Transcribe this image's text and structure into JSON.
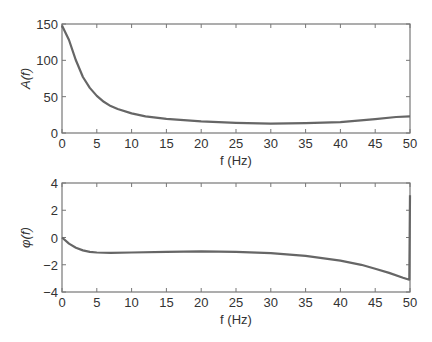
{
  "chart_data": [
    {
      "type": "line",
      "title": "",
      "xlabel": "f (Hz)",
      "ylabel": "A(f)",
      "xlim": [
        0,
        50
      ],
      "ylim": [
        0,
        150
      ],
      "xticks": [
        0,
        5,
        10,
        15,
        20,
        25,
        30,
        35,
        40,
        45,
        50
      ],
      "yticks": [
        0,
        50,
        100,
        150
      ],
      "grid": false,
      "series": [
        {
          "name": "A(f)",
          "color": "#666666",
          "x": [
            0,
            1,
            2,
            3,
            4,
            5,
            6,
            7,
            8,
            10,
            12,
            15,
            20,
            25,
            30,
            35,
            40,
            45,
            48,
            50
          ],
          "y": [
            148,
            128,
            100,
            77,
            62,
            51,
            43,
            37,
            33,
            27,
            23,
            19.5,
            16,
            14,
            13,
            13.5,
            15,
            19,
            22,
            23
          ]
        }
      ]
    },
    {
      "type": "line",
      "title": "",
      "xlabel": "f (Hz)",
      "ylabel": "φ(f)",
      "xlim": [
        0,
        50
      ],
      "ylim": [
        -4,
        4
      ],
      "xticks": [
        0,
        5,
        10,
        15,
        20,
        25,
        30,
        35,
        40,
        45,
        50
      ],
      "yticks": [
        -4,
        -2,
        0,
        2,
        4
      ],
      "grid": false,
      "series": [
        {
          "name": "phi(f)",
          "color": "#666666",
          "x": [
            0,
            1,
            2,
            3,
            4,
            5,
            7,
            10,
            15,
            20,
            25,
            30,
            35,
            40,
            43,
            45,
            47,
            49,
            49.9,
            50
          ],
          "y": [
            0,
            -0.45,
            -0.75,
            -0.95,
            -1.05,
            -1.1,
            -1.12,
            -1.1,
            -1.05,
            -1.02,
            -1.05,
            -1.15,
            -1.35,
            -1.7,
            -2.0,
            -2.3,
            -2.6,
            -2.95,
            -3.1,
            3.1
          ]
        }
      ]
    }
  ]
}
